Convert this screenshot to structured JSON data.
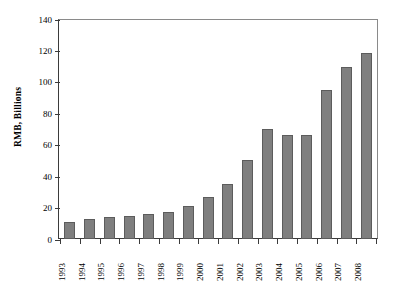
{
  "chart_data": {
    "type": "bar",
    "title": "",
    "xlabel": "",
    "ylabel": "RMB, Billions",
    "categories": [
      "1993",
      "1994",
      "1995",
      "1996",
      "1997",
      "1998",
      "1999",
      "2000",
      "2001",
      "2002",
      "2003",
      "2004",
      "2005",
      "2006",
      "2007",
      "2008"
    ],
    "values": [
      11,
      12.5,
      14,
      14.5,
      16,
      17.5,
      21,
      27,
      35,
      50,
      70,
      66,
      66,
      95,
      109.5,
      118.5
    ],
    "ylim": [
      0,
      140
    ],
    "yticks": [
      0,
      20,
      40,
      60,
      80,
      100,
      120,
      140
    ],
    "ytick_labels": [
      "0",
      "20",
      "40",
      "60",
      "80",
      "100",
      "120",
      "140"
    ],
    "grid": false,
    "legend": false,
    "legend_position": "none",
    "bar_color": "#7f7f7f",
    "bar_edge_color": "#5c5c5c",
    "axis_color": "#3b3b3b",
    "background_color": "#ffffff"
  }
}
